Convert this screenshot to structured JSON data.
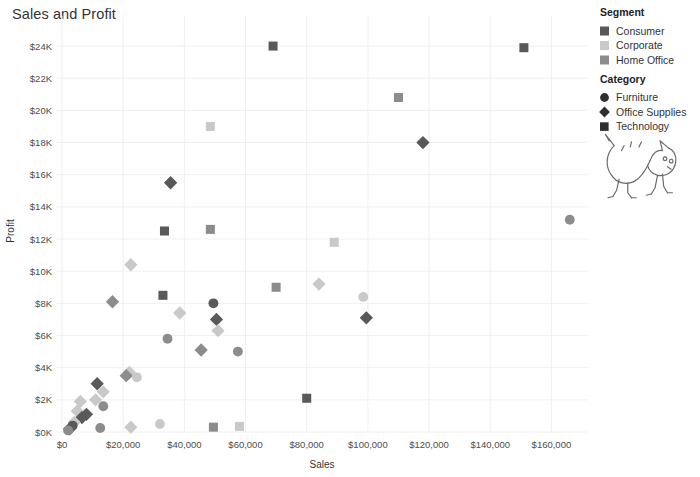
{
  "chart_data": {
    "type": "scatter",
    "title": "Sales and Profit",
    "xlabel": "Sales",
    "ylabel": "Profit",
    "xlim": [
      0,
      170000
    ],
    "ylim": [
      0,
      25000
    ],
    "grid": true,
    "x_ticks": [
      0,
      20000,
      40000,
      60000,
      80000,
      100000,
      120000,
      140000,
      160000
    ],
    "x_tick_labels": [
      "$0",
      "$20,000",
      "$40,000",
      "$60,000",
      "$80,000",
      "$100,000",
      "$120,000",
      "$140,000",
      "$160,000"
    ],
    "y_ticks": [
      0,
      2000,
      4000,
      6000,
      8000,
      10000,
      12000,
      14000,
      16000,
      18000,
      20000,
      22000,
      24000
    ],
    "y_tick_labels": [
      "$0K",
      "$2K",
      "$4K",
      "$6K",
      "$8K",
      "$10K",
      "$12K",
      "$14K",
      "$16K",
      "$18K",
      "$20K",
      "$22K",
      "$24K"
    ],
    "legend_position": "right",
    "encodings": {
      "color": {
        "field": "Segment",
        "values": [
          "Consumer",
          "Corporate",
          "Home Office"
        ]
      },
      "shape": {
        "field": "Category",
        "values": [
          "Furniture",
          "Office Supplies",
          "Technology"
        ]
      }
    },
    "colors": {
      "Consumer": "#595959",
      "Corporate": "#c9c9c9",
      "Home Office": "#8c8c8c"
    },
    "shapes": {
      "Furniture": "circle",
      "Office Supplies": "diamond",
      "Technology": "square"
    },
    "points": [
      {
        "x": 69000,
        "y": 24000,
        "segment": "Consumer",
        "category": "Technology"
      },
      {
        "x": 151000,
        "y": 23900,
        "segment": "Consumer",
        "category": "Technology"
      },
      {
        "x": 110000,
        "y": 20800,
        "segment": "Home Office",
        "category": "Technology"
      },
      {
        "x": 48500,
        "y": 19000,
        "segment": "Corporate",
        "category": "Technology"
      },
      {
        "x": 118000,
        "y": 18000,
        "segment": "Consumer",
        "category": "Office Supplies"
      },
      {
        "x": 35500,
        "y": 15500,
        "segment": "Consumer",
        "category": "Office Supplies"
      },
      {
        "x": 166000,
        "y": 13200,
        "segment": "Home Office",
        "category": "Furniture"
      },
      {
        "x": 48500,
        "y": 12600,
        "segment": "Home Office",
        "category": "Technology"
      },
      {
        "x": 33500,
        "y": 12500,
        "segment": "Consumer",
        "category": "Technology"
      },
      {
        "x": 89000,
        "y": 11800,
        "segment": "Corporate",
        "category": "Technology"
      },
      {
        "x": 22500,
        "y": 10400,
        "segment": "Corporate",
        "category": "Office Supplies"
      },
      {
        "x": 84000,
        "y": 9200,
        "segment": "Corporate",
        "category": "Office Supplies"
      },
      {
        "x": 70000,
        "y": 9000,
        "segment": "Home Office",
        "category": "Technology"
      },
      {
        "x": 98500,
        "y": 8400,
        "segment": "Corporate",
        "category": "Furniture"
      },
      {
        "x": 33000,
        "y": 8500,
        "segment": "Consumer",
        "category": "Technology"
      },
      {
        "x": 16500,
        "y": 8100,
        "segment": "Home Office",
        "category": "Office Supplies"
      },
      {
        "x": 38500,
        "y": 7400,
        "segment": "Corporate",
        "category": "Office Supplies"
      },
      {
        "x": 99500,
        "y": 7100,
        "segment": "Consumer",
        "category": "Office Supplies"
      },
      {
        "x": 50500,
        "y": 7000,
        "segment": "Consumer",
        "category": "Office Supplies"
      },
      {
        "x": 49500,
        "y": 8000,
        "segment": "Consumer",
        "category": "Furniture"
      },
      {
        "x": 51000,
        "y": 6300,
        "segment": "Corporate",
        "category": "Office Supplies"
      },
      {
        "x": 34500,
        "y": 5800,
        "segment": "Home Office",
        "category": "Furniture"
      },
      {
        "x": 45500,
        "y": 5100,
        "segment": "Home Office",
        "category": "Office Supplies"
      },
      {
        "x": 57500,
        "y": 5000,
        "segment": "Home Office",
        "category": "Furniture"
      },
      {
        "x": 22000,
        "y": 3700,
        "segment": "Corporate",
        "category": "Office Supplies"
      },
      {
        "x": 21000,
        "y": 3500,
        "segment": "Home Office",
        "category": "Office Supplies"
      },
      {
        "x": 24500,
        "y": 3400,
        "segment": "Corporate",
        "category": "Furniture"
      },
      {
        "x": 11500,
        "y": 3000,
        "segment": "Consumer",
        "category": "Office Supplies"
      },
      {
        "x": 13500,
        "y": 2500,
        "segment": "Corporate",
        "category": "Office Supplies"
      },
      {
        "x": 80000,
        "y": 2100,
        "segment": "Consumer",
        "category": "Technology"
      },
      {
        "x": 11000,
        "y": 2000,
        "segment": "Corporate",
        "category": "Office Supplies"
      },
      {
        "x": 13500,
        "y": 1600,
        "segment": "Home Office",
        "category": "Furniture"
      },
      {
        "x": 6000,
        "y": 1900,
        "segment": "Corporate",
        "category": "Office Supplies"
      },
      {
        "x": 5000,
        "y": 1300,
        "segment": "Corporate",
        "category": "Office Supplies"
      },
      {
        "x": 8000,
        "y": 1100,
        "segment": "Consumer",
        "category": "Office Supplies"
      },
      {
        "x": 6500,
        "y": 900,
        "segment": "Consumer",
        "category": "Office Supplies"
      },
      {
        "x": 4000,
        "y": 600,
        "segment": "Corporate",
        "category": "Office Supplies"
      },
      {
        "x": 3500,
        "y": 400,
        "segment": "Consumer",
        "category": "Furniture"
      },
      {
        "x": 2500,
        "y": 200,
        "segment": "Consumer",
        "category": "Office Supplies"
      },
      {
        "x": 2000,
        "y": 100,
        "segment": "Home Office",
        "category": "Furniture"
      },
      {
        "x": 12500,
        "y": 250,
        "segment": "Home Office",
        "category": "Furniture"
      },
      {
        "x": 22500,
        "y": 300,
        "segment": "Corporate",
        "category": "Office Supplies"
      },
      {
        "x": 32000,
        "y": 500,
        "segment": "Corporate",
        "category": "Furniture"
      },
      {
        "x": 49500,
        "y": 300,
        "segment": "Home Office",
        "category": "Technology"
      },
      {
        "x": 58000,
        "y": 350,
        "segment": "Corporate",
        "category": "Technology"
      }
    ]
  },
  "legend": {
    "segment": {
      "title": "Segment",
      "items": [
        {
          "label": "Consumer",
          "color": "#595959"
        },
        {
          "label": "Corporate",
          "color": "#c9c9c9"
        },
        {
          "label": "Home Office",
          "color": "#8c8c8c"
        }
      ]
    },
    "category": {
      "title": "Category",
      "items": [
        {
          "label": "Furniture",
          "shape": "circle"
        },
        {
          "label": "Office Supplies",
          "shape": "diamond"
        },
        {
          "label": "Technology",
          "shape": "square"
        }
      ]
    }
  },
  "decoration": {
    "name": "cat-drawing"
  }
}
